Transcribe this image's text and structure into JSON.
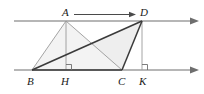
{
  "figure": {
    "type": "geometry-diagram",
    "width": 204,
    "height": 94,
    "background_color": "#ffffff",
    "stroke_color": "#3a3a3a",
    "thin_stroke_color": "#8a8a8a",
    "shade_color": "#eeeeee",
    "labels": {
      "a": "A",
      "d": "D",
      "b": "B",
      "h": "H",
      "c": "C",
      "k": "K"
    },
    "points": {
      "A": {
        "x": 66,
        "y": 21
      },
      "D": {
        "x": 142,
        "y": 21
      },
      "B": {
        "x": 32,
        "y": 70
      },
      "H": {
        "x": 66,
        "y": 70
      },
      "C": {
        "x": 122,
        "y": 70
      },
      "K": {
        "x": 142,
        "y": 70
      }
    },
    "top_line": {
      "x1": 14,
      "y1": 21,
      "x2": 196,
      "y2": 21,
      "arrow": "right"
    },
    "bottom_line": {
      "x1": 14,
      "y1": 70,
      "x2": 196,
      "y2": 70,
      "arrow": "right"
    },
    "ad_arrow": {
      "x1": 74,
      "y1": 15,
      "x2": 134,
      "y2": 15,
      "arrow": "right"
    },
    "right_angles": [
      "H",
      "K"
    ],
    "shaded_region": "B-C-D",
    "segments": [
      {
        "name": "BA",
        "from": "B",
        "to": "A",
        "weight": "thin"
      },
      {
        "name": "AH",
        "from": "A",
        "to": "H",
        "weight": "thin"
      },
      {
        "name": "AC",
        "from": "A",
        "to": "C",
        "weight": "thin"
      },
      {
        "name": "DK",
        "from": "D",
        "to": "K",
        "weight": "thin"
      },
      {
        "name": "BD",
        "from": "B",
        "to": "D",
        "weight": "thick"
      },
      {
        "name": "DC",
        "from": "D",
        "to": "C",
        "weight": "thick"
      },
      {
        "name": "BC",
        "from": "B",
        "to": "C",
        "weight": "thick"
      }
    ]
  }
}
